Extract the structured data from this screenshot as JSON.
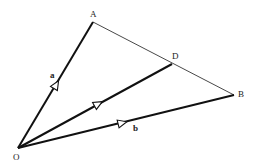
{
  "diagram": {
    "points": {
      "O": {
        "label": "O",
        "x": 18,
        "y": 148
      },
      "A": {
        "label": "A",
        "x": 93,
        "y": 22
      },
      "B": {
        "label": "B",
        "x": 234,
        "y": 95
      },
      "D": {
        "label": "D",
        "x": 172,
        "y": 64
      }
    },
    "vectors": {
      "a": {
        "label": "a",
        "from": "O",
        "to": "A"
      },
      "b": {
        "label": "b",
        "from": "O",
        "to": "B"
      },
      "d": {
        "label": "",
        "from": "O",
        "to": "D"
      }
    },
    "segments": [
      {
        "from": "A",
        "to": "B",
        "style": "thin"
      }
    ],
    "colors": {
      "stroke": "#111111",
      "thin_stroke": "#333333",
      "background": "#ffffff"
    }
  }
}
